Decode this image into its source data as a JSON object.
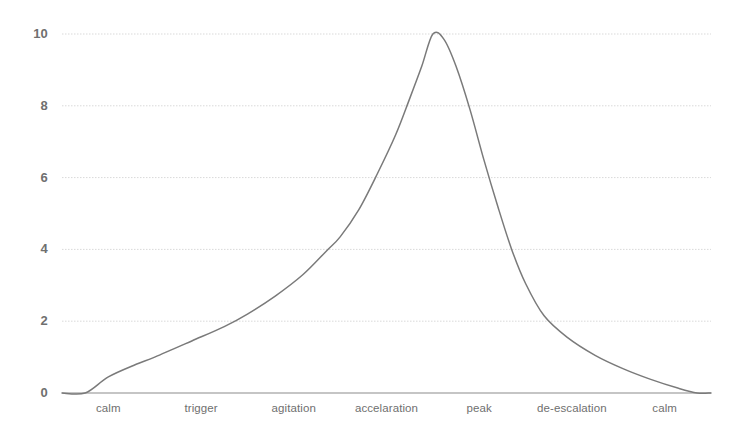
{
  "chart_data": {
    "type": "line",
    "title": "",
    "subtitle": "",
    "xlabel": "",
    "ylabel": "",
    "grid": true,
    "legend": false,
    "legend_position": "none",
    "xlim": [
      0,
      7
    ],
    "ylim": [
      0,
      10
    ],
    "yticks": [
      "0",
      "2",
      "4",
      "6",
      "8",
      "10"
    ],
    "ytick_values": [
      0,
      2,
      4,
      6,
      8,
      10
    ],
    "categories": [
      "calm",
      "trigger",
      "agitation",
      "accelaration",
      "peak",
      "de-escalation",
      "calm"
    ],
    "series": [
      {
        "name": "escalation-cycle",
        "color": "#7a7a7a",
        "values": [
          0,
          1.0,
          2.2,
          4.2,
          10,
          2.3,
          0
        ]
      }
    ],
    "points": [
      {
        "x": 0.0,
        "y": 0.0
      },
      {
        "x": 0.25,
        "y": 0.0
      },
      {
        "x": 0.5,
        "y": 0.45
      },
      {
        "x": 0.8,
        "y": 0.8
      },
      {
        "x": 1.0,
        "y": 1.0
      },
      {
        "x": 1.4,
        "y": 1.45
      },
      {
        "x": 1.75,
        "y": 1.85
      },
      {
        "x": 2.0,
        "y": 2.2
      },
      {
        "x": 2.3,
        "y": 2.7
      },
      {
        "x": 2.6,
        "y": 3.3
      },
      {
        "x": 2.85,
        "y": 3.95
      },
      {
        "x": 3.0,
        "y": 4.35
      },
      {
        "x": 3.2,
        "y": 5.1
      },
      {
        "x": 3.4,
        "y": 6.1
      },
      {
        "x": 3.6,
        "y": 7.2
      },
      {
        "x": 3.75,
        "y": 8.2
      },
      {
        "x": 3.88,
        "y": 9.1
      },
      {
        "x": 4.0,
        "y": 10.0
      },
      {
        "x": 4.12,
        "y": 9.85
      },
      {
        "x": 4.25,
        "y": 9.1
      },
      {
        "x": 4.4,
        "y": 7.9
      },
      {
        "x": 4.55,
        "y": 6.5
      },
      {
        "x": 4.7,
        "y": 5.2
      },
      {
        "x": 4.85,
        "y": 4.0
      },
      {
        "x": 5.0,
        "y": 3.05
      },
      {
        "x": 5.2,
        "y": 2.15
      },
      {
        "x": 5.45,
        "y": 1.55
      },
      {
        "x": 5.75,
        "y": 1.05
      },
      {
        "x": 6.05,
        "y": 0.68
      },
      {
        "x": 6.35,
        "y": 0.38
      },
      {
        "x": 6.65,
        "y": 0.13
      },
      {
        "x": 6.85,
        "y": 0.0
      },
      {
        "x": 7.0,
        "y": 0.0
      }
    ],
    "colors": {
      "line": "#7a7a7a",
      "grid": "#d9d9d9",
      "axis": "#8c8c8c",
      "tick_text": "#6f6f6f",
      "background": "#ffffff"
    }
  }
}
